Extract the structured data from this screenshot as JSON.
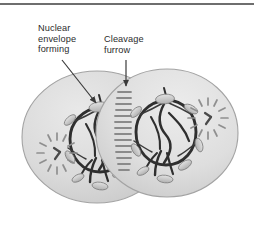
{
  "figure": {
    "background_color": "#ffffff",
    "top_rule_color": "#6e6e6e",
    "width": 254,
    "height": 233
  },
  "labels": [
    {
      "id": "nuclear-envelope-forming",
      "text": "Nuclear\nenvelope\nforming",
      "color": "#2b2b2b",
      "pointer": "arrow-down-right"
    },
    {
      "id": "cleavage-furrow",
      "text": "Cleavage\nfurrow",
      "color": "#2b2b2b",
      "pointer": "arrow-down"
    }
  ],
  "cells": [
    {
      "id": "daughter-cell-left",
      "fill_color": "#d9d9d9",
      "outline_color": "#9a9a9a",
      "centrosome_position": "lower-left",
      "chromatin_color": "#2f2f2f"
    },
    {
      "id": "daughter-cell-right",
      "fill_color": "#dcdcdc",
      "outline_color": "#9a9a9a",
      "centrosome_position": "right",
      "chromatin_color": "#2f2f2f"
    }
  ],
  "structures": {
    "nuclear_envelope_fragment_color": "#bdbdbd",
    "nuclear_envelope_fragment_outline": "#7d7d7d",
    "cleavage_furrow_fiber_color": "#8a8a8a",
    "centrosome_ray_color": "#8f8f8f",
    "centriole_color": "#4a4a4a",
    "arrow_color": "#3a3a3a"
  }
}
